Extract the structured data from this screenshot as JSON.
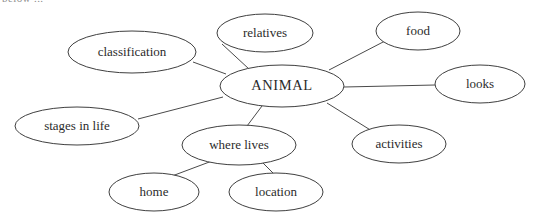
{
  "page": {
    "background_color": "#ffffff",
    "clipped_caption": "below ...",
    "width": 534,
    "height": 221
  },
  "style": {
    "edge_color": "#4a4a4a",
    "node_stroke_color": "#3f3f3f",
    "node_fill_color": "#ffffff",
    "label_color": "#2b2b2b"
  },
  "diagram": {
    "type": "mind-map",
    "central_topic": "ANIMAL",
    "nodes": [
      {
        "id": "animal",
        "label": "ANIMAL",
        "cx": 282,
        "cy": 86,
        "rx": 62,
        "ry": 21,
        "central": true
      },
      {
        "id": "classification",
        "label": "classification",
        "cx": 132,
        "cy": 52,
        "rx": 64,
        "ry": 21,
        "central": false
      },
      {
        "id": "relatives",
        "label": "relatives",
        "cx": 265,
        "cy": 33,
        "rx": 48,
        "ry": 19,
        "central": false
      },
      {
        "id": "food",
        "label": "food",
        "cx": 418,
        "cy": 31,
        "rx": 42,
        "ry": 19,
        "central": false
      },
      {
        "id": "looks",
        "label": "looks",
        "cx": 480,
        "cy": 84,
        "rx": 45,
        "ry": 19,
        "central": false
      },
      {
        "id": "activities",
        "label": "activities",
        "cx": 399,
        "cy": 144,
        "rx": 47,
        "ry": 19,
        "central": false
      },
      {
        "id": "stages",
        "label": "stages in life",
        "cx": 77,
        "cy": 126,
        "rx": 62,
        "ry": 19,
        "central": false
      },
      {
        "id": "where_lives",
        "label": "where lives",
        "cx": 239,
        "cy": 145,
        "rx": 57,
        "ry": 20,
        "central": false
      },
      {
        "id": "home",
        "label": "home",
        "cx": 154,
        "cy": 192,
        "rx": 45,
        "ry": 19,
        "central": false
      },
      {
        "id": "location",
        "label": "location",
        "cx": 276,
        "cy": 192,
        "rx": 47,
        "ry": 19,
        "central": false
      }
    ],
    "edges": [
      {
        "id": "animal-classification",
        "from": "animal",
        "to": "classification",
        "x1": 226,
        "y1": 74,
        "x2": 193,
        "y2": 62
      },
      {
        "id": "animal-relatives",
        "from": "animal",
        "to": "relatives",
        "x1": 249,
        "y1": 69,
        "x2": 222,
        "y2": 44
      },
      {
        "id": "animal-food",
        "from": "animal",
        "to": "food",
        "x1": 329,
        "y1": 70,
        "x2": 385,
        "y2": 41
      },
      {
        "id": "animal-looks",
        "from": "animal",
        "to": "looks",
        "x1": 344,
        "y1": 87,
        "x2": 435,
        "y2": 85
      },
      {
        "id": "animal-activities",
        "from": "animal",
        "to": "activities",
        "x1": 327,
        "y1": 103,
        "x2": 372,
        "y2": 131
      },
      {
        "id": "animal-stages",
        "from": "animal",
        "to": "stages",
        "x1": 223,
        "y1": 97,
        "x2": 138,
        "y2": 119
      },
      {
        "id": "animal-wherelives",
        "from": "animal",
        "to": "where lives",
        "x1": 262,
        "y1": 106,
        "x2": 247,
        "y2": 126
      },
      {
        "id": "wherelives-home",
        "from": "where lives",
        "to": "home",
        "x1": 212,
        "y1": 161,
        "x2": 172,
        "y2": 176
      },
      {
        "id": "wherelives-location",
        "from": "where lives",
        "to": "location",
        "x1": 263,
        "y1": 163,
        "x2": 274,
        "y2": 174
      }
    ]
  }
}
